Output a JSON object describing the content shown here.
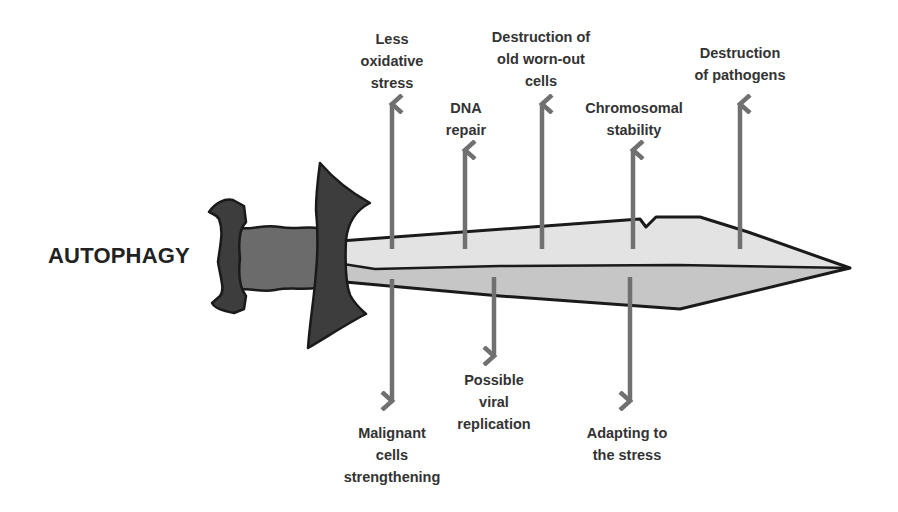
{
  "title": "AUTOPHAGY",
  "colors": {
    "outline": "#1a1a1a",
    "hilt_dark": "#3c3c3c",
    "grip": "#6a6a6a",
    "blade_top": "#e4e4e4",
    "blade_bottom": "#c4c4c4",
    "arrow": "#707070",
    "text": "#333333"
  },
  "benefits": [
    {
      "id": "less-oxidative-stress",
      "label": "Less\noxidative\nstress",
      "x": 392
    },
    {
      "id": "dna-repair",
      "label": "DNA\nrepair",
      "x": 466
    },
    {
      "id": "destruction-old-cells",
      "label": "Destruction of\nold worn-out\ncells",
      "x": 541
    },
    {
      "id": "chromosomal-stability",
      "label": "Chromosomal\nstability",
      "x": 634
    },
    {
      "id": "destruction-pathogens",
      "label": "Destruction\nof pathogens",
      "x": 740
    }
  ],
  "harms": [
    {
      "id": "malignant-cells",
      "label": "Malignant\ncells\nstrengthening",
      "x": 392
    },
    {
      "id": "viral-replication",
      "label": "Possible\nviral\nreplication",
      "x": 494
    },
    {
      "id": "adapting-stress",
      "label": "Adapting to\nthe stress",
      "x": 630
    }
  ]
}
